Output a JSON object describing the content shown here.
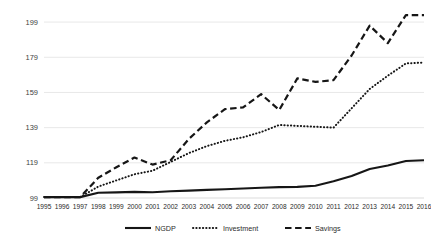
{
  "chart_data": {
    "type": "line",
    "title": "",
    "subtitle": "",
    "xlabel": "",
    "ylabel": "",
    "x": [
      "1995",
      "1996",
      "1997",
      "1998",
      "1999",
      "2000",
      "2001",
      "2002",
      "2003",
      "2004",
      "2005",
      "2006",
      "2007",
      "2008",
      "2009",
      "2010",
      "2011",
      "2012",
      "2013",
      "2014",
      "2015",
      "2016"
    ],
    "categories": [
      "1995",
      "1996",
      "1997",
      "1998",
      "1999",
      "2000",
      "2001",
      "2002",
      "2003",
      "2004",
      "2005",
      "2006",
      "2007",
      "2008",
      "2009",
      "2010",
      "2011",
      "2012",
      "2013",
      "2014",
      "2015",
      "2016"
    ],
    "ylim": [
      99,
      207
    ],
    "yticks": [
      99,
      119,
      139,
      159,
      179,
      199
    ],
    "ytick_labels": [
      "99",
      "119",
      "139",
      "159",
      "179",
      "199"
    ],
    "grid": true,
    "legend_position": "bottom",
    "series": [
      {
        "name": "NGDP",
        "style": "solid",
        "color": "#161616",
        "values": [
          99.5,
          99.5,
          99.5,
          102.0,
          102.2,
          102.5,
          102.3,
          102.8,
          103.2,
          103.6,
          104.0,
          104.4,
          104.8,
          105.2,
          105.3,
          106.0,
          108.5,
          111.5,
          115.5,
          117.5,
          120.0,
          120.5
        ]
      },
      {
        "name": "Investment",
        "style": "dotted",
        "color": "#161616",
        "values": [
          99.5,
          99.5,
          99.5,
          105.5,
          109.0,
          112.5,
          114.5,
          119.5,
          124.5,
          128.5,
          131.5,
          133.5,
          136.5,
          140.5,
          140.0,
          139.5,
          139.0,
          150.0,
          161.0,
          168.5,
          175.5,
          176.0
        ]
      },
      {
        "name": "Savings",
        "style": "dashed",
        "color": "#161616",
        "values": [
          99.5,
          99.5,
          99.5,
          110.5,
          116.5,
          122.0,
          118.0,
          120.5,
          132.5,
          142.0,
          149.5,
          150.5,
          158.0,
          149.0,
          167.0,
          165.0,
          166.0,
          180.0,
          197.0,
          187.0,
          203.0,
          203.0
        ]
      }
    ],
    "legend": [
      {
        "label": "NGDP",
        "style": "solid"
      },
      {
        "label": "Investment",
        "style": "dotted"
      },
      {
        "label": "Savings",
        "style": "dashed"
      }
    ]
  }
}
